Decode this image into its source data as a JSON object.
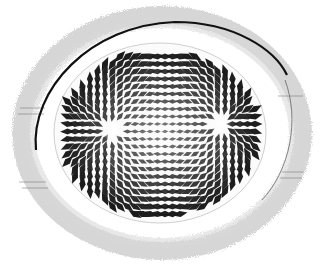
{
  "illustration": {
    "subject": "engraved oval disc with radial dipole pattern of diamond-shaped markings",
    "colors": {
      "background": "#ffffff",
      "ink": "#1a1a1a",
      "halo": "#9a9a9a",
      "rim": "#111111"
    },
    "poles": [
      {
        "cx": 112,
        "cy": 130
      },
      {
        "cx": 220,
        "cy": 124
      }
    ]
  }
}
